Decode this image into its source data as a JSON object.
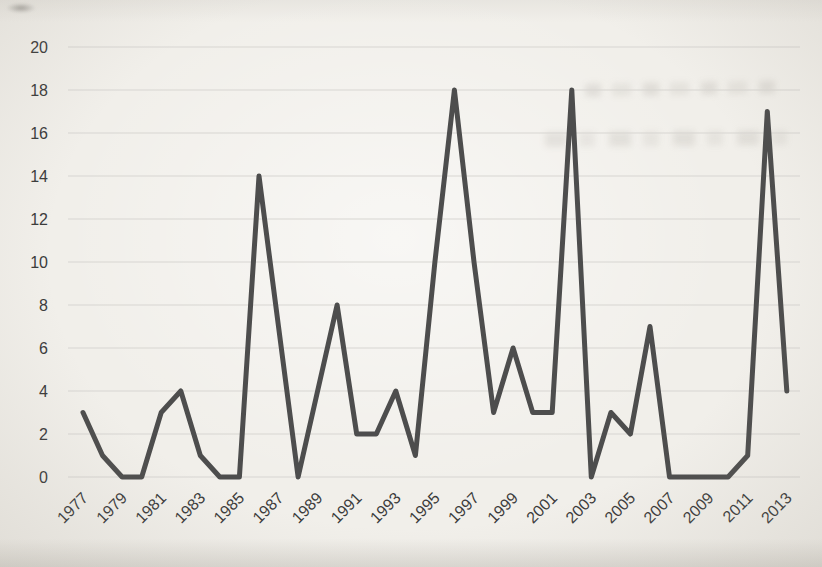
{
  "chart_data": {
    "type": "line",
    "title": "",
    "xlabel": "",
    "ylabel": "",
    "legend": "none",
    "grid": "horizontal-only",
    "xlim": [
      1977,
      2013
    ],
    "ylim": [
      0,
      20
    ],
    "x": [
      1977,
      1978,
      1979,
      1980,
      1981,
      1982,
      1983,
      1984,
      1985,
      1986,
      1987,
      1988,
      1989,
      1990,
      1991,
      1992,
      1993,
      1994,
      1995,
      1996,
      1997,
      1998,
      1999,
      2000,
      2001,
      2002,
      2003,
      2004,
      2005,
      2006,
      2007,
      2008,
      2009,
      2010,
      2011,
      2012,
      2013
    ],
    "series": [
      {
        "name": "",
        "values": [
          3,
          1,
          0,
          0,
          3,
          4,
          1,
          0,
          0,
          14,
          7,
          0,
          4,
          8,
          2,
          2,
          4,
          1,
          10,
          18,
          10,
          3,
          6,
          3,
          3,
          18,
          0,
          3,
          2,
          7,
          0,
          0,
          0,
          0,
          1,
          17,
          4
        ]
      }
    ],
    "x_tick_labels": [
      "1977",
      "1979",
      "1981",
      "1983",
      "1985",
      "1987",
      "1989",
      "1991",
      "1993",
      "1995",
      "1997",
      "1999",
      "2001",
      "2003",
      "2005",
      "2007",
      "2009",
      "2011",
      "2013"
    ],
    "y_tick_labels": [
      "0",
      "2",
      "4",
      "6",
      "8",
      "10",
      "12",
      "14",
      "16",
      "18",
      "20"
    ],
    "colors": {
      "line": "#4d4d4d",
      "gridline": "#d8d6d1",
      "tick_label": "#3b3b3b",
      "background": "#f1efea"
    }
  }
}
